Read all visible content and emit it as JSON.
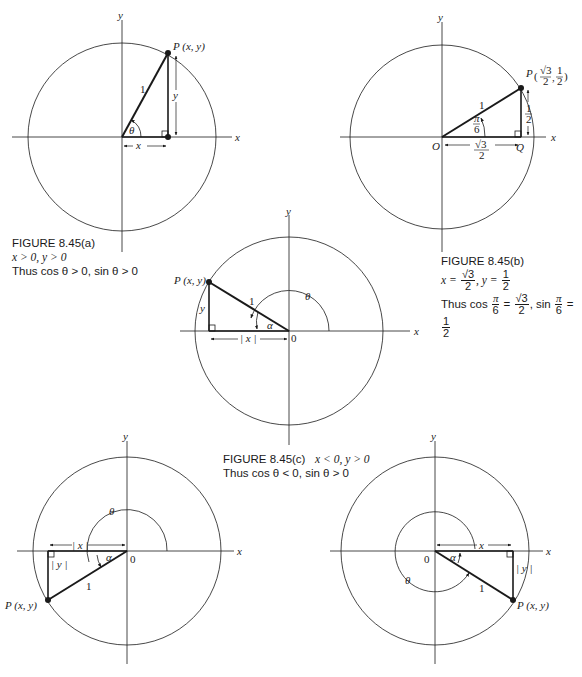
{
  "figures": {
    "a": {
      "caption_title": "FIGURE 8.45(a)",
      "caption_line1": "x > 0, y > 0",
      "caption_line2": "Thus cos θ > 0, sin θ > 0",
      "labels": {
        "x_axis": "x",
        "y_axis": "y",
        "point": "P (x, y)",
        "hyp": "1",
        "angle": "θ",
        "horiz": "x",
        "vert": "y"
      }
    },
    "b": {
      "caption_title": "FIGURE 8.45(b)",
      "caption_line1_prefix": "x =",
      "caption_line1_num": "√3",
      "caption_line1_den": "2",
      "caption_line1_mid": ", y =",
      "caption_line1_num2": "1",
      "caption_line1_den2": "2",
      "caption_line2_prefix": "Thus cos",
      "pi": "π",
      "six": "6",
      "eq": "=",
      "sqrt3": "√3",
      "two": "2",
      "sin": ", sin",
      "one": "1",
      "labels": {
        "x_axis": "x",
        "y_axis": "y",
        "point": "P",
        "point_coords": "(√3/2, 1/2)",
        "hyp": "1",
        "angle": "π/6",
        "origin": "O",
        "foot": "Q",
        "horiz": "√3/2",
        "vert": "1/2"
      }
    },
    "c": {
      "caption_title": "FIGURE 8.45(c)",
      "caption_cond": "x < 0, y > 0",
      "caption_line2": "Thus cos θ < 0, sin θ > 0",
      "labels": {
        "x_axis": "x",
        "y_axis": "y",
        "point": "P (x, y)",
        "hyp": "1",
        "angle": "θ",
        "ref_angle": "α",
        "origin": "0",
        "horiz": "| x |",
        "vert": "y"
      }
    },
    "d": {
      "labels": {
        "x_axis": "x",
        "y_axis": "y",
        "point": "P (x, y)",
        "hyp": "1",
        "angle": "θ",
        "ref_angle": "α",
        "origin": "0",
        "horiz": "| x |",
        "vert": "| y |"
      }
    },
    "e": {
      "labels": {
        "x_axis": "x",
        "y_axis": "y",
        "point": "P (x, y)",
        "hyp": "1",
        "angle": "θ",
        "ref_angle": "α",
        "origin": "0",
        "horiz": "x",
        "vert": "| y |"
      }
    }
  },
  "colors": {
    "ink": "#1a1a1a",
    "background": "#ffffff"
  }
}
